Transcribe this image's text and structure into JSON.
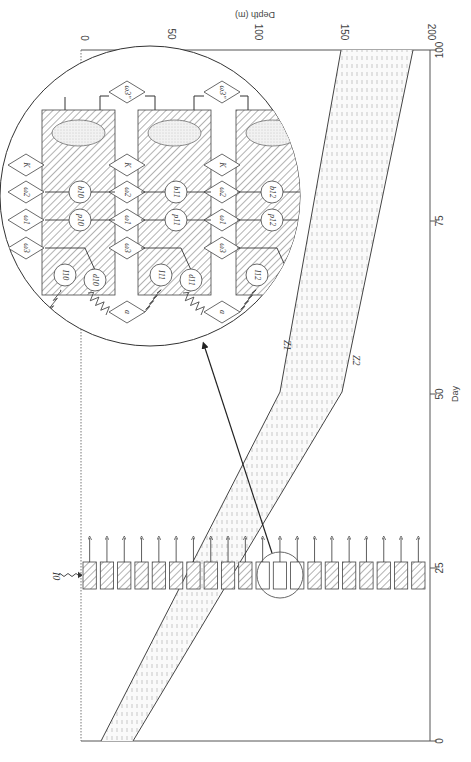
{
  "figure": {
    "orientation": "rotated 90deg clockwise (depth axis on top, day axis on right)",
    "depth_axis": {
      "title": "Depth (m)",
      "ticks": [
        "0",
        "50",
        "100",
        "150",
        "200"
      ]
    },
    "day_axis": {
      "title": "Day",
      "ticks": [
        "0",
        "25",
        "50",
        "75",
        "100"
      ]
    },
    "band_labels": {
      "upper": "Z1",
      "lower": "Z2"
    },
    "light_input_label": "I0",
    "inset": {
      "diamond_labels": {
        "K": "K",
        "omega1": "ω1",
        "omega2": "ω2",
        "omega3": "ω3",
        "omega3pp": "ω3''",
        "a": "a"
      },
      "columns": [
        {
          "index": "10",
          "b": "b10",
          "p": "p10",
          "I": "I10",
          "d": "d10"
        },
        {
          "index": "11",
          "b": "b11",
          "p": "p11",
          "I": "I11",
          "d": "d11"
        },
        {
          "index": "12",
          "b": "b12",
          "p": "p12",
          "I": "I12",
          "d": "d12"
        }
      ]
    },
    "layer_count": 20,
    "highlighted_layers": [
      11,
      12,
      13
    ]
  },
  "chart_data": {
    "type": "area",
    "title": "",
    "xlabel": "Day",
    "ylabel": "Depth (m)",
    "xlim": [
      0,
      100
    ],
    "ylim": [
      0,
      200
    ],
    "series": [
      {
        "name": "Z1",
        "x": [
          0,
          50,
          100
        ],
        "values": [
          12,
          115,
          150
        ]
      },
      {
        "name": "Z2",
        "x": [
          0,
          50,
          100
        ],
        "values": [
          30,
          150,
          190
        ]
      }
    ],
    "annotations": [
      "I0 light input at surface",
      "Layer boxes at Day ~25 with upward arrows",
      "Inset circle shows compartment model (K, ω1, ω2, ω3, b, p, I, d, a, ω3'')"
    ]
  }
}
